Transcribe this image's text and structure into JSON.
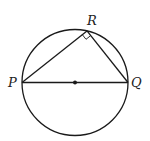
{
  "diagram": {
    "type": "geometry",
    "colors": {
      "stroke": "#1a1a1a",
      "background": "#ffffff",
      "label": "#222222"
    },
    "circle": {
      "cx": 75,
      "cy": 82.5,
      "r": 53
    },
    "points": {
      "P": {
        "label": "P",
        "x": 22,
        "y": 82.5
      },
      "Q": {
        "label": "Q",
        "x": 128,
        "y": 82.5
      },
      "R": {
        "label": "R",
        "x": 87,
        "y": 30.9
      },
      "center": {
        "x": 75,
        "y": 82.5
      }
    },
    "segments": [
      "PQ",
      "PR",
      "RQ"
    ],
    "annotations": {
      "right_angle_at": "R",
      "center_dot": true
    }
  }
}
